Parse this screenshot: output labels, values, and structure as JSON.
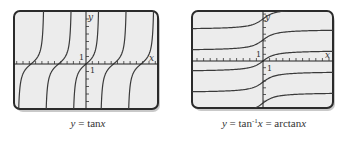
{
  "chart_data": [
    {
      "type": "line",
      "title": "y = tan x",
      "caption": {
        "lhs": "y",
        "eq": " = tan",
        "var": "x"
      },
      "function": "tan",
      "xlabel": "x",
      "ylabel": "y",
      "tick_label_x": "1",
      "tick_label_y": "1",
      "grid": false,
      "period_px": 27.5,
      "branches_zero_crossings_x_units": [
        -2,
        -1,
        0,
        1,
        2
      ],
      "xlim": [
        -3.5,
        3.5
      ],
      "ylim": [
        -3,
        3
      ],
      "description": "Five branches of y = tan x, repeating every pi with vertical asymptotes between branches"
    },
    {
      "type": "line",
      "title": "y = tan^-1 x = arctan x",
      "caption": {
        "lhs": "y",
        "eq": " = tan",
        "sup": "-1",
        "var": "x",
        "eq2": " = arctan",
        "var2": "x"
      },
      "function": "arctan (multi-valued branches shifted by kπ)",
      "xlabel": "x",
      "ylabel": "y",
      "tick_label_x": "1",
      "tick_label_y": "1",
      "grid": false,
      "branch_offsets_pi": [
        -2,
        -1,
        0,
        1,
        2
      ],
      "xlim": [
        -10,
        10
      ],
      "ylim": [
        -7,
        7
      ],
      "description": "Branches of the inverse relation of tan: arctan x + kπ, each bounded by horizontal asymptotes"
    }
  ],
  "colors": {
    "plot_bg": "#ececec",
    "frame": "#2b2b2b",
    "curve": "#3a3a3a",
    "axis": "#222222"
  }
}
